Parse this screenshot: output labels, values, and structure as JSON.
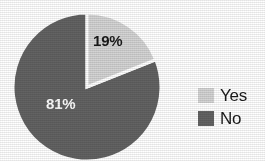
{
  "chart_data": {
    "type": "pie",
    "title": "",
    "categories": [
      "Yes",
      "No"
    ],
    "values": [
      19,
      81
    ],
    "labels": [
      "19%",
      "81%"
    ],
    "colors": [
      "#d4d4d4",
      "#636363"
    ],
    "legend_position": "right",
    "grid": false,
    "start_angle_deg": 0,
    "direction": "clockwise",
    "slices": [
      {
        "name": "Yes",
        "value": 19,
        "label": "19%",
        "color": "#d4d4d4",
        "label_color": "#1a1a1a"
      },
      {
        "name": "No",
        "value": 81,
        "label": "81%",
        "color": "#636363",
        "label_color": "#ffffff"
      }
    ]
  },
  "legend": {
    "items": [
      {
        "label": "Yes",
        "color": "#d4d4d4"
      },
      {
        "label": "No",
        "color": "#636363"
      }
    ]
  },
  "style": {
    "background": "#ffffff",
    "separator_color": "#ffffff",
    "text_color": "#1a1a1a"
  }
}
